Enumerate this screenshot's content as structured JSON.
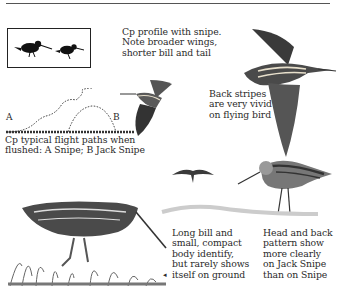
{
  "page": {
    "captions": {
      "profile": [
        "Cp profile with snipe.",
        "Note broader wings,",
        "shorter bill and tail"
      ],
      "back_stripes": [
        "Back stripes",
        "are very vivid",
        "on flying bird"
      ],
      "flight_paths": [
        "Cp typical flight paths when",
        "flushed: A Snipe; B Jack Snipe"
      ],
      "long_bill": [
        "Long bill and",
        "small, compact",
        "body identify,",
        "but rarely shows",
        "itself on ground"
      ],
      "head_back": [
        "Head and back",
        "pattern show",
        "more clearly",
        "on Jack Snipe",
        "than on Snipe"
      ]
    },
    "path_labels": {
      "a": "A",
      "b": "B"
    },
    "pointer_glyph": "◂"
  }
}
